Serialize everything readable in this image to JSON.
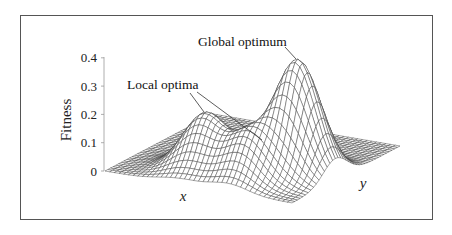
{
  "chart_data": {
    "type": "surface",
    "title": "",
    "zlabel": "Fitness",
    "xlabel": "x",
    "ylabel": "y",
    "zlim": [
      0,
      0.4
    ],
    "z_ticks": [
      {
        "value": 0,
        "label": "0"
      },
      {
        "value": 0.1,
        "label": "0.1"
      },
      {
        "value": 0.2,
        "label": "0.2"
      },
      {
        "value": 0.3,
        "label": "0.3"
      },
      {
        "value": 0.4,
        "label": "0.4"
      }
    ],
    "grid": false,
    "surface": {
      "description": "Fitness landscape: sum of Gaussian peaks over a square (x,y) domain",
      "resolution": 40,
      "peaks": [
        {
          "name": "global",
          "u": 0.8,
          "v": 0.4,
          "height": 0.4,
          "sigma": 0.11
        },
        {
          "name": "local-1",
          "u": 0.4,
          "v": 0.24,
          "height": 0.2,
          "sigma": 0.11
        },
        {
          "name": "local-2",
          "u": 0.66,
          "v": 0.18,
          "height": 0.15,
          "sigma": 0.1
        }
      ]
    },
    "annotations": [
      {
        "text": "Global optimum",
        "points_to": "global"
      },
      {
        "text": "Local optima",
        "points_to": [
          "local-1",
          "local-2"
        ]
      }
    ]
  },
  "labels": {
    "zaxis": "Fitness",
    "x": "x",
    "y": "y",
    "global": "Global optimum",
    "local": "Local optima"
  }
}
